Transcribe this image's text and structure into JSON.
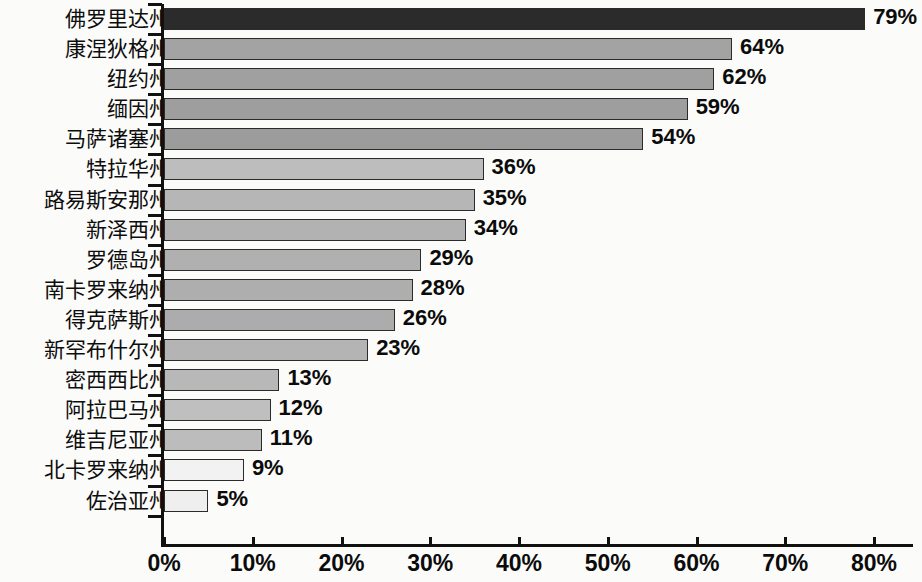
{
  "chart_data": {
    "type": "bar",
    "orientation": "horizontal",
    "title": "",
    "subtitle": "",
    "xlabel": "",
    "ylabel": "",
    "xlim": [
      0,
      80
    ],
    "grid": false,
    "legend": null,
    "value_suffix": "%",
    "categories": [
      "佛罗里达州",
      "康涅狄格州",
      "纽约州",
      "缅因州",
      "马萨诸塞州",
      "特拉华州",
      "路易斯安那州",
      "新泽西州",
      "罗德岛州",
      "南卡罗来纳州",
      "得克萨斯州",
      "新罕布什尔州",
      "密西西比州",
      "阿拉巴马州",
      "维吉尼亚州",
      "北卡罗来纳州",
      "佐治亚州"
    ],
    "values": [
      79,
      64,
      62,
      59,
      54,
      36,
      35,
      34,
      29,
      28,
      26,
      23,
      13,
      12,
      11,
      9,
      5
    ],
    "data_labels": [
      "79%",
      "64%",
      "62%",
      "59%",
      "54%",
      "36%",
      "35%",
      "34%",
      "29%",
      "28%",
      "26%",
      "23%",
      "13%",
      "12%",
      "11%",
      "9%",
      "5%"
    ],
    "bar_colors": [
      "#2b2b2b",
      "#a3a3a3",
      "#a0a0a0",
      "#9e9e9e",
      "#9c9c9c",
      "#bdbdbd",
      "#b6b6b6",
      "#b2b2b2",
      "#b0b0b0",
      "#aeaeae",
      "#acacac",
      "#b4b4b4",
      "#b8b8b8",
      "#bfbfbf",
      "#bcbcbc",
      "#f2f2f2",
      "#efefef"
    ],
    "bar_border_color": "#2b2b2b",
    "xticks": [
      0,
      10,
      20,
      30,
      40,
      50,
      60,
      70,
      80
    ],
    "xtick_labels": [
      "0%",
      "10%",
      "20%",
      "30%",
      "40%",
      "50%",
      "60%",
      "70%",
      "80%"
    ],
    "axis_color": "#111111",
    "background_color": "#fbfbfa",
    "text_color": "#0b0b0b"
  }
}
